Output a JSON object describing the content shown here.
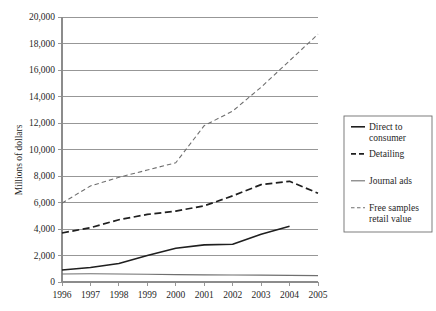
{
  "chart_data": {
    "type": "line",
    "title": "",
    "xlabel": "",
    "ylabel": "Millions of dollars",
    "x": [
      1996,
      1997,
      1998,
      1999,
      2000,
      2001,
      2002,
      2003,
      2004,
      2005
    ],
    "xticklabels": [
      "1996",
      "1997",
      "1998",
      "1999",
      "2000",
      "2001",
      "2002",
      "2003",
      "2004",
      "2005"
    ],
    "yticklabels": [
      "0",
      "2,000",
      "4,000",
      "6,000",
      "8,000",
      "10,000",
      "12,000",
      "14,000",
      "16,000",
      "18,000",
      "20,000"
    ],
    "yticks": [
      0,
      2000,
      4000,
      6000,
      8000,
      10000,
      12000,
      14000,
      16000,
      18000,
      20000
    ],
    "ylim": [
      0,
      20000
    ],
    "grid": "horizontal",
    "legend_position": "right",
    "series": [
      {
        "name": "Direct to consumer",
        "style": "solid",
        "width": 1.6,
        "color": "#1f1f1f",
        "values": [
          900,
          1100,
          1400,
          2000,
          2550,
          2800,
          2850,
          3600,
          4200,
          null
        ]
      },
      {
        "name": "Detailing",
        "style": "dashed-thick",
        "width": 1.7,
        "color": "#1f1f1f",
        "values": [
          3700,
          4100,
          4700,
          5100,
          5350,
          5750,
          6500,
          7350,
          7600,
          6700
        ]
      },
      {
        "name": "Journal ads",
        "style": "solid",
        "width": 1.1,
        "color": "#6f6f6f",
        "values": [
          600,
          620,
          600,
          580,
          560,
          540,
          530,
          520,
          500,
          480
        ]
      },
      {
        "name": "Free samples retail value",
        "style": "dashed-thin",
        "width": 1.1,
        "color": "#6f6f6f",
        "values": [
          5950,
          7250,
          7900,
          8450,
          9000,
          11800,
          12900,
          14700,
          16700,
          18700
        ]
      }
    ]
  },
  "legend": {
    "entries": [
      {
        "label_line1": "Direct to",
        "label_line2": "consumer"
      },
      {
        "label_line1": "Detailing",
        "label_line2": ""
      },
      {
        "label_line1": "Journal ads",
        "label_line2": ""
      },
      {
        "label_line1": "Free samples",
        "label_line2": "retail value"
      }
    ]
  },
  "colors": {
    "axis": "#8c8c8c",
    "grid": "#8c8c8c",
    "text": "#1f1f1f",
    "dark_series": "#1f1f1f",
    "light_series": "#6f6f6f",
    "background": "#ffffff"
  }
}
